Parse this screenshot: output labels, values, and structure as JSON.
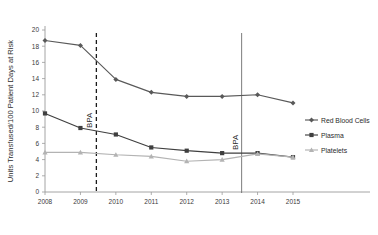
{
  "chart_data": {
    "type": "line",
    "title": "",
    "xlabel": "",
    "ylabel": "Units Transfused/100 Patient Days at Risk",
    "categories": [
      "2008",
      "2009",
      "2010",
      "2011",
      "2012",
      "2013",
      "2014",
      "2015"
    ],
    "x": [
      2008,
      2009,
      2010,
      2011,
      2012,
      2013,
      2014,
      2015
    ],
    "xlim": [
      2008,
      2015
    ],
    "ylim": [
      0,
      20
    ],
    "yticks": [
      0,
      2,
      4,
      6,
      8,
      10,
      12,
      14,
      16,
      18,
      20
    ],
    "xticks": [
      "2008",
      "2009",
      "2010",
      "2011",
      "2012",
      "2013",
      "2014",
      "2015"
    ],
    "grid": false,
    "legend_position": "right",
    "series": [
      {
        "name": "Red Blood Cells",
        "color": "#595959",
        "marker": "diamond",
        "values": [
          18.7,
          18.1,
          13.9,
          12.3,
          11.8,
          11.8,
          12.0,
          11.0
        ]
      },
      {
        "name": "Plasma",
        "color": "#3f3f3f",
        "marker": "square",
        "values": [
          9.7,
          7.9,
          7.1,
          5.5,
          5.1,
          4.8,
          4.8,
          4.3
        ]
      },
      {
        "name": "Platelets",
        "color": "#b3b3b3",
        "marker": "triangle",
        "values": [
          4.9,
          4.9,
          4.6,
          4.4,
          3.8,
          4.0,
          4.7,
          4.3
        ]
      }
    ],
    "annotations": [
      {
        "label": "BPA",
        "x": 2009.45,
        "style": "dashed",
        "color": "#1a1a1a"
      },
      {
        "label": "BPA",
        "x": 2013.55,
        "style": "solid",
        "color": "#6e6e6e"
      }
    ]
  },
  "legend": {
    "items": [
      {
        "label": "Red Blood Cells"
      },
      {
        "label": "Plasma"
      },
      {
        "label": "Platelets"
      }
    ]
  }
}
